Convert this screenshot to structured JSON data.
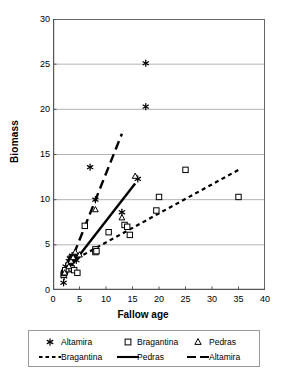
{
  "chart_data": {
    "type": "scatter",
    "title": "",
    "xlabel": "Fallow age",
    "ylabel": "Biomass",
    "xlim": [
      0,
      40
    ],
    "ylim": [
      0,
      30
    ],
    "xticks": [
      0,
      5,
      10,
      15,
      20,
      25,
      30,
      35,
      40
    ],
    "yticks": [
      0,
      5,
      10,
      15,
      20,
      25,
      30
    ],
    "grid": "horizontal",
    "legend_position": "below-plot",
    "series": [
      {
        "name": "Altamira",
        "kind": "scatter",
        "marker": "asterisk",
        "color": "#000000",
        "points": [
          [
            2.0,
            0.8
          ],
          [
            2.1,
            1.5
          ],
          [
            2.2,
            2.0
          ],
          [
            2.4,
            2.6
          ],
          [
            3.0,
            3.2
          ],
          [
            3.2,
            3.5
          ],
          [
            3.4,
            3.6
          ],
          [
            3.6,
            3.8
          ],
          [
            3.8,
            3.4
          ],
          [
            4.0,
            3.5
          ],
          [
            4.2,
            3.9
          ],
          [
            4.4,
            3.3
          ],
          [
            7.0,
            13.6
          ],
          [
            8.0,
            10.0
          ],
          [
            16.0,
            12.3
          ],
          [
            17.5,
            25.1
          ],
          [
            17.5,
            20.3
          ],
          [
            13.0,
            8.6
          ]
        ]
      },
      {
        "name": "Bragantina",
        "kind": "scatter",
        "marker": "square",
        "color": "#000000",
        "points": [
          [
            2.0,
            1.7
          ],
          [
            2.1,
            1.9
          ],
          [
            2.3,
            2.2
          ],
          [
            3.0,
            2.3
          ],
          [
            3.5,
            2.4
          ],
          [
            4.0,
            2.2
          ],
          [
            4.6,
            1.9
          ],
          [
            6.0,
            7.1
          ],
          [
            8.0,
            4.5
          ],
          [
            8.0,
            4.2
          ],
          [
            8.2,
            4.3
          ],
          [
            10.5,
            6.4
          ],
          [
            13.5,
            7.2
          ],
          [
            14.0,
            7.0
          ],
          [
            14.5,
            6.1
          ],
          [
            19.5,
            8.8
          ],
          [
            20.0,
            10.3
          ],
          [
            25.0,
            13.3
          ],
          [
            35.0,
            10.3
          ]
        ]
      },
      {
        "name": "Pedras",
        "kind": "scatter",
        "marker": "triangle",
        "color": "#000000",
        "points": [
          [
            2.2,
            1.9
          ],
          [
            3.0,
            2.6
          ],
          [
            3.4,
            3.2
          ],
          [
            3.8,
            3.6
          ],
          [
            4.2,
            4.2
          ],
          [
            5.0,
            3.9
          ],
          [
            8.0,
            8.9
          ],
          [
            13.0,
            8.0
          ],
          [
            15.5,
            12.6
          ]
        ]
      },
      {
        "name": "Bragantina",
        "kind": "trendline",
        "style": "dotted",
        "color": "#000000",
        "from": [
          4.5,
          3.5
        ],
        "to": [
          35.0,
          13.3
        ]
      },
      {
        "name": "Pedras",
        "kind": "trendline",
        "style": "solid",
        "color": "#000000",
        "from": [
          2.0,
          1.6
        ],
        "to": [
          15.5,
          11.8
        ]
      },
      {
        "name": "Altamira",
        "kind": "trendline",
        "style": "dashed",
        "color": "#000000",
        "from": [
          3.0,
          2.6
        ],
        "to": [
          13.0,
          17.3
        ]
      }
    ]
  },
  "legend": {
    "row1": [
      {
        "label": "Altamira",
        "marker": "asterisk"
      },
      {
        "label": "Bragantina",
        "marker": "square"
      },
      {
        "label": "Pedras",
        "marker": "triangle"
      }
    ],
    "row2": [
      {
        "label": "Bragantina",
        "marker": "dotted-line"
      },
      {
        "label": "Pedras",
        "marker": "solid-line"
      },
      {
        "label": "Altamira",
        "marker": "dashed-line"
      }
    ]
  }
}
